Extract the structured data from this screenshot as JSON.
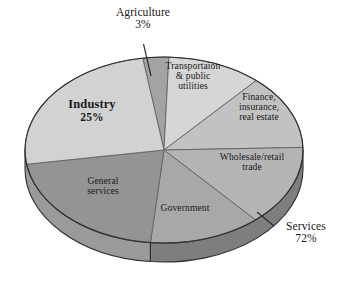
{
  "chart_data": {
    "type": "pie",
    "title": "",
    "subtitle": "",
    "xlabel": "",
    "ylabel": "",
    "legend_position": "none",
    "grid": false,
    "style": "3d-pie",
    "categories": [
      "Agriculture",
      "Transportaion & public utilities",
      "Finance, insurance, real estate",
      "Wholesale/retail trade",
      "Government",
      "General services",
      "Industry"
    ],
    "values": [
      3,
      11,
      13,
      14,
      13,
      21,
      25
    ],
    "units": "percent",
    "groups": [
      {
        "name": "Agriculture",
        "value": 3,
        "label": "3%"
      },
      {
        "name": "Industry",
        "value": 25,
        "label": "25%"
      },
      {
        "name": "Services",
        "value": 72,
        "label": "72%"
      }
    ],
    "slices": [
      {
        "name": "Agriculture",
        "value": 3,
        "color": "#a3a3a3",
        "start_deg": 351.2,
        "end_deg": 362.0,
        "label_inside": false
      },
      {
        "name": "Transportaion & public utilities",
        "value": 11,
        "color": "#d6d6d6",
        "start_deg": 2.0,
        "end_deg": 41.6,
        "label_inside": true
      },
      {
        "name": "Finance, insurance, real estate",
        "value": 13,
        "color": "#c2c2c2",
        "start_deg": 41.6,
        "end_deg": 88.4,
        "label_inside": true
      },
      {
        "name": "Wholesale/retail trade",
        "value": 14,
        "color": "#b4b4b4",
        "start_deg": 88.4,
        "end_deg": 138.8,
        "label_inside": true
      },
      {
        "name": "Government",
        "value": 13,
        "color": "#a8a8a8",
        "start_deg": 138.8,
        "end_deg": 185.6,
        "label_inside": true
      },
      {
        "name": "General services",
        "value": 21,
        "color": "#949494",
        "start_deg": 185.6,
        "end_deg": 261.2,
        "label_inside": true
      },
      {
        "name": "Industry",
        "value": 25,
        "color": "#d2d2d2",
        "start_deg": 261.2,
        "end_deg": 351.2,
        "label_inside": true
      }
    ]
  },
  "labels": {
    "agriculture": {
      "name": "Agriculture",
      "pct": "3%"
    },
    "industry": {
      "name": "Industry",
      "pct": "25%"
    },
    "services": {
      "name": "Services",
      "pct": "72%"
    },
    "transportation": {
      "line1": "Transportaion",
      "line2": "& public",
      "line3": "utilities"
    },
    "finance": {
      "line1": "Finance,",
      "line2": "insurance,",
      "line3": "real estate"
    },
    "wholesale": {
      "line1": "Wholesale/retail",
      "line2": "trade"
    },
    "government": {
      "line1": "Government"
    },
    "general_services": {
      "line1": "General",
      "line2": "services"
    }
  },
  "colors": {
    "background": "#ffffff",
    "text": "#1a1a1a",
    "outline": "#3a3a3a",
    "side_wall_light": "#9a9a9a",
    "side_wall_dark": "#7e7e7e",
    "leader_line": "#2b2b2b"
  }
}
